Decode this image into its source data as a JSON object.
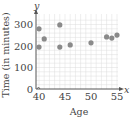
{
  "chart_data": {
    "type": "scatter",
    "title": "",
    "xlabel": "Age",
    "ylabel": "Time (in minutes)",
    "x_axis_letter": "x",
    "y_axis_letter": "y",
    "xlim": [
      39.5,
      56
    ],
    "ylim": [
      0,
      340
    ],
    "x_ticks": [
      40,
      45,
      50,
      55
    ],
    "y_ticks": [
      0,
      100,
      200,
      300
    ],
    "grid": true,
    "points": [
      {
        "x": 40,
        "y": 280
      },
      {
        "x": 40,
        "y": 195
      },
      {
        "x": 41,
        "y": 233
      },
      {
        "x": 44,
        "y": 298
      },
      {
        "x": 44,
        "y": 195
      },
      {
        "x": 46,
        "y": 205
      },
      {
        "x": 50,
        "y": 215
      },
      {
        "x": 53,
        "y": 242
      },
      {
        "x": 54,
        "y": 237
      },
      {
        "x": 55,
        "y": 251
      }
    ],
    "colors": {
      "point": "#8a8a8a",
      "grid": "#dcdcdc",
      "axis": "#555555"
    }
  }
}
